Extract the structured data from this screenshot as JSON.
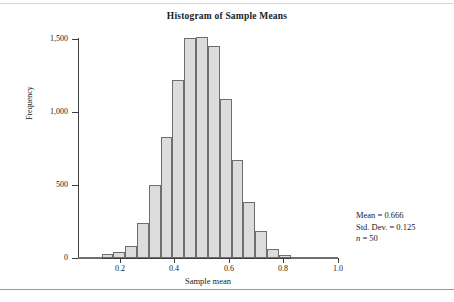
{
  "figure": {
    "title": "Histogram of Sample Means",
    "x_axis_title": "Sample mean",
    "y_axis_title": "Frequency"
  },
  "annotations": {
    "mean_label": "Mean = 0.666",
    "stddev_label": "Std. Dev. = 0.125",
    "n_symbol": "n",
    "n_label": " = 50"
  },
  "style": {
    "bar_fill": "#dcdcdc",
    "bar_stroke": "#6e6e6e",
    "axis_color": "#3d3d3d",
    "text_color": "#1a1a1a",
    "background": "#ffffff"
  },
  "chart_data": {
    "type": "bar",
    "title": "Histogram of Sample Means",
    "xlabel": "Sample mean",
    "ylabel": "Frequency",
    "xlim": [
      0.047,
      1.0
    ],
    "ylim": [
      0,
      1500
    ],
    "grid": false,
    "legend": null,
    "bin_width": 0.0433,
    "xticks": [
      0.2,
      0.4,
      0.6,
      0.8,
      1.0
    ],
    "xtick_labels": [
      "0.2",
      "0.4",
      "0.6",
      "0.8",
      "1.0"
    ],
    "yticks": [
      0,
      500,
      1000,
      1500
    ],
    "ytick_labels": [
      "0",
      "500",
      "1,000",
      "1,500"
    ],
    "bins": [
      {
        "x0": 0.047,
        "x1": 0.09,
        "value": 5
      },
      {
        "x0": 0.09,
        "x1": 0.134,
        "value": 6
      },
      {
        "x0": 0.134,
        "x1": 0.177,
        "value": 30
      },
      {
        "x0": 0.177,
        "x1": 0.22,
        "value": 42
      },
      {
        "x0": 0.22,
        "x1": 0.264,
        "value": 85
      },
      {
        "x0": 0.264,
        "x1": 0.307,
        "value": 240
      },
      {
        "x0": 0.307,
        "x1": 0.35,
        "value": 500
      },
      {
        "x0": 0.35,
        "x1": 0.393,
        "value": 830
      },
      {
        "x0": 0.393,
        "x1": 0.437,
        "value": 1220
      },
      {
        "x0": 0.437,
        "x1": 0.48,
        "value": 1510
      },
      {
        "x0": 0.48,
        "x1": 0.523,
        "value": 1515
      },
      {
        "x0": 0.523,
        "x1": 0.567,
        "value": 1455
      },
      {
        "x0": 0.567,
        "x1": 0.61,
        "value": 1090
      },
      {
        "x0": 0.61,
        "x1": 0.653,
        "value": 670
      },
      {
        "x0": 0.653,
        "x1": 0.697,
        "value": 385
      },
      {
        "x0": 0.697,
        "x1": 0.74,
        "value": 185
      },
      {
        "x0": 0.74,
        "x1": 0.783,
        "value": 60
      },
      {
        "x0": 0.783,
        "x1": 0.827,
        "value": 18
      },
      {
        "x0": 0.827,
        "x1": 0.87,
        "value": 10
      },
      {
        "x0": 0.87,
        "x1": 0.913,
        "value": 6
      },
      {
        "x0": 0.913,
        "x1": 0.957,
        "value": 4
      },
      {
        "x0": 0.957,
        "x1": 1.0,
        "value": 2
      }
    ],
    "statistics": {
      "mean": 0.666,
      "std_dev": 0.125,
      "n": 50
    }
  }
}
